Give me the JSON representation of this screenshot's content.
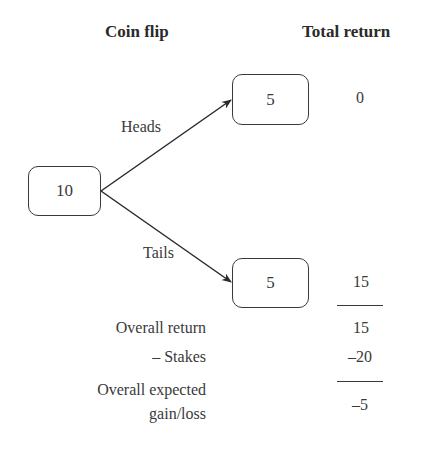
{
  "headers": {
    "coin_flip": "Coin flip",
    "total_return": "Total return"
  },
  "tree": {
    "root": {
      "value": "10"
    },
    "branches": [
      {
        "label": "Heads",
        "node_value": "5",
        "total_return": "0"
      },
      {
        "label": "Tails",
        "node_value": "5",
        "total_return": "15"
      }
    ]
  },
  "summary": {
    "rows": [
      {
        "label": "Overall return",
        "value": "15"
      },
      {
        "label": "– Stakes",
        "value": "–20"
      },
      {
        "label_line1": "Overall expected",
        "label_line2": "gain/loss",
        "value": "–5"
      }
    ]
  },
  "colors": {
    "line": "#3a3a3a",
    "text": "#3a3a3a",
    "background": "#ffffff"
  }
}
